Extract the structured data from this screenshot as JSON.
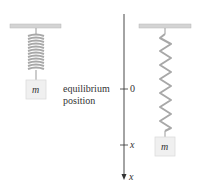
{
  "diagram": {
    "left_system": {
      "mass_label": "m",
      "description": "spring at rest, compressed coils, mass at equilibrium"
    },
    "right_system": {
      "mass_label": "m",
      "description": "spring stretched, mass displaced to x"
    },
    "axis": {
      "equilibrium_label_line1": "equilibrium",
      "equilibrium_label_line2": "position",
      "tick_zero": "0",
      "tick_x": "x",
      "arrow_label": "x"
    },
    "colors": {
      "ceiling": "#c8c8c8",
      "spring": "#a8a8a8",
      "mass_fill": "#f0f0f0",
      "mass_border": "#d8d8d8",
      "axis": "#333333"
    }
  }
}
